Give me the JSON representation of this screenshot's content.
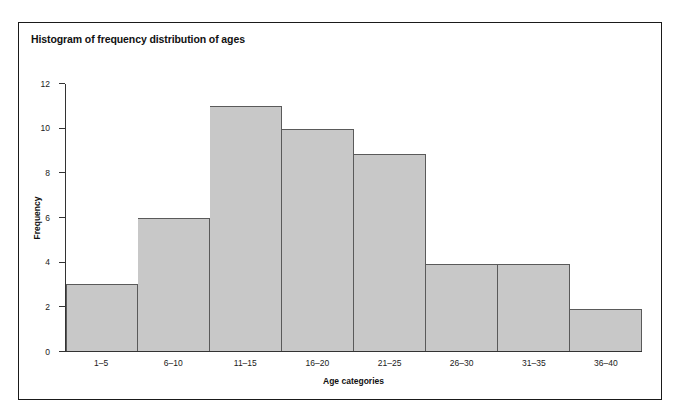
{
  "figure": {
    "title": "Histogram of frequency distribution of ages",
    "frame_color": "#1a1a1a",
    "background": "#ffffff"
  },
  "chart_data": {
    "type": "bar",
    "title": "Histogram of frequency distribution of ages",
    "xlabel": "Age categories",
    "ylabel": "Frequency",
    "categories": [
      "1–5",
      "6–10",
      "11–15",
      "16–20",
      "21–25",
      "26–30",
      "31–35",
      "36–40"
    ],
    "values": [
      3,
      6,
      11,
      10,
      8.85,
      3.9,
      3.9,
      1.9
    ],
    "ylim": [
      0,
      12
    ],
    "yticks": [
      0,
      2,
      4,
      6,
      8,
      10,
      12
    ],
    "ytick_labels": [
      "0",
      "2",
      "4",
      "6",
      "8",
      "10",
      "12"
    ],
    "grid": false,
    "legend": null,
    "bar_fill_color": "#c8c8c8",
    "bar_edge_color": "#5a5a5a",
    "axis_color": "#333333"
  }
}
